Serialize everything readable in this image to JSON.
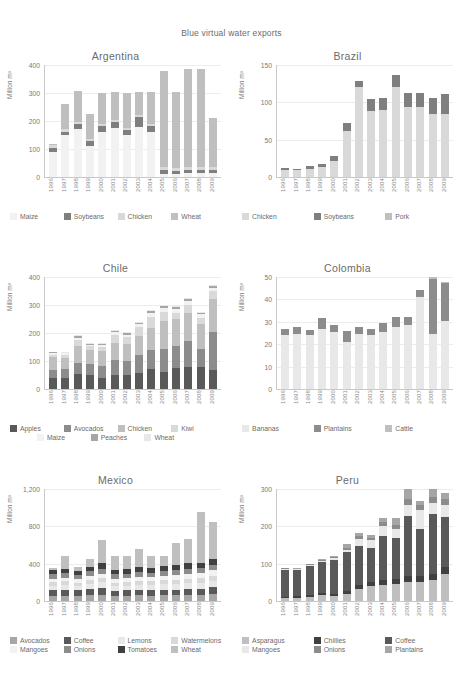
{
  "figure": {
    "title": "Blue virtual water exports",
    "ylabel": "Million m³"
  },
  "years": [
    "1996",
    "1997",
    "1998",
    "1999",
    "2000",
    "2001",
    "2002",
    "2003",
    "2004",
    "2005",
    "2006",
    "2007",
    "2008",
    "2009"
  ],
  "colors": {
    "c1": "#d9d9d9",
    "c2": "#7f7f7f",
    "c3": "#f2f2f2",
    "c4": "#bfbfbf",
    "c5": "#595959",
    "c6": "#a6a6a6",
    "c7": "#e8e8e8",
    "c8": "#8c8c8c"
  },
  "chart_data": [
    {
      "type": "bar",
      "title": "Argentina",
      "ylabel": "Million m³",
      "xlabel": "",
      "ylim": [
        0,
        400
      ],
      "yticks": [
        0,
        100,
        200,
        300,
        400
      ],
      "ytick_labels": [
        "0",
        "100",
        "200",
        "300",
        "400"
      ],
      "grid": true,
      "stacked": true,
      "legend_position": "bottom",
      "legend_columns": 4,
      "categories": [
        "1996",
        "1997",
        "1998",
        "1999",
        "2000",
        "2001",
        "2002",
        "2003",
        "2004",
        "2005",
        "2006",
        "2007",
        "2008",
        "2009"
      ],
      "series": [
        {
          "name": "Maize",
          "color": "#f2f2f2",
          "values": [
            88,
            150,
            170,
            110,
            160,
            175,
            150,
            180,
            160,
            10,
            10,
            14,
            14,
            14
          ]
        },
        {
          "name": "Soybeans",
          "color": "#7f7f7f",
          "values": [
            15,
            12,
            20,
            18,
            22,
            20,
            18,
            35,
            22,
            15,
            12,
            12,
            12,
            12
          ]
        },
        {
          "name": "Chicken",
          "color": "#d9d9d9",
          "values": [
            10,
            8,
            8,
            8,
            8,
            8,
            8,
            8,
            8,
            10,
            10,
            10,
            10,
            10
          ]
        },
        {
          "name": "Wheat",
          "color": "#bfbfbf",
          "values": [
            5,
            90,
            110,
            90,
            110,
            100,
            125,
            80,
            115,
            345,
            270,
            350,
            350,
            175
          ]
        }
      ]
    },
    {
      "type": "bar",
      "title": "Brazil",
      "ylabel": "Million m³",
      "xlabel": "",
      "ylim": [
        0,
        150
      ],
      "yticks": [
        0,
        50,
        100,
        150
      ],
      "ytick_labels": [
        "0",
        "50",
        "100",
        "150"
      ],
      "grid": true,
      "stacked": true,
      "legend_position": "bottom",
      "legend_columns": 3,
      "categories": [
        "1996",
        "1997",
        "1998",
        "1999",
        "2000",
        "2001",
        "2002",
        "2003",
        "2004",
        "2005",
        "2006",
        "2007",
        "2008",
        "2009"
      ],
      "series": [
        {
          "name": "Chicken",
          "color": "#d9d9d9",
          "values": [
            9,
            9,
            11,
            14,
            22,
            62,
            120,
            88,
            90,
            120,
            94,
            94,
            84,
            84
          ]
        },
        {
          "name": "Soybeans",
          "color": "#7f7f7f",
          "values": [
            3,
            2,
            4,
            4,
            6,
            10,
            9,
            16,
            16,
            17,
            18,
            18,
            22,
            27
          ]
        },
        {
          "name": "Pork",
          "color": "#bfbfbf",
          "values": [
            0,
            0,
            0,
            0,
            0,
            0,
            0,
            0,
            0,
            0,
            0,
            0,
            0,
            0
          ]
        }
      ]
    },
    {
      "type": "bar",
      "title": "Chile",
      "ylabel": "Million m³",
      "xlabel": "",
      "ylim": [
        0,
        400
      ],
      "yticks": [
        0,
        100,
        200,
        300,
        400
      ],
      "ytick_labels": [
        "0",
        "100",
        "200",
        "300",
        "400"
      ],
      "grid": true,
      "stacked": true,
      "legend_position": "bottom",
      "legend_columns": 4,
      "categories": [
        "1996",
        "1997",
        "1998",
        "1999",
        "2000",
        "2001",
        "2002",
        "2003",
        "2004",
        "2005",
        "2006",
        "2007",
        "2008",
        "2009"
      ],
      "series": [
        {
          "name": "Apples",
          "color": "#595959",
          "values": [
            40,
            40,
            52,
            50,
            40,
            50,
            50,
            58,
            72,
            62,
            75,
            78,
            78,
            68
          ]
        },
        {
          "name": "Avocados",
          "color": "#8c8c8c",
          "values": [
            28,
            30,
            42,
            40,
            44,
            52,
            50,
            62,
            68,
            82,
            78,
            92,
            65,
            135
          ]
        },
        {
          "name": "Chicken",
          "color": "#bfbfbf",
          "values": [
            45,
            42,
            60,
            50,
            52,
            62,
            62,
            68,
            78,
            100,
            98,
            100,
            88,
            118
          ]
        },
        {
          "name": "Kiwi",
          "color": "#d9d9d9",
          "values": [
            10,
            10,
            22,
            12,
            14,
            28,
            22,
            32,
            40,
            32,
            22,
            30,
            22,
            30
          ]
        },
        {
          "name": "Maize",
          "color": "#f2f2f2",
          "values": [
            5,
            5,
            8,
            6,
            8,
            10,
            10,
            12,
            14,
            14,
            14,
            14,
            14,
            10
          ]
        },
        {
          "name": "Peaches",
          "color": "#a6a6a6",
          "values": [
            3,
            3,
            5,
            4,
            4,
            5,
            5,
            5,
            6,
            6,
            6,
            6,
            6,
            6
          ]
        },
        {
          "name": "Wheat",
          "color": "#e8e8e8",
          "values": [
            2,
            2,
            3,
            3,
            3,
            3,
            3,
            3,
            4,
            4,
            4,
            4,
            4,
            4
          ]
        }
      ]
    },
    {
      "type": "bar",
      "title": "Colombia",
      "ylabel": "Million m³",
      "xlabel": "",
      "ylim": [
        0,
        50
      ],
      "yticks": [
        0,
        10,
        20,
        30,
        40,
        50
      ],
      "ytick_labels": [
        "0",
        "10",
        "20",
        "30",
        "40",
        "50"
      ],
      "grid": true,
      "stacked": true,
      "legend_position": "bottom",
      "legend_columns": 3,
      "categories": [
        "1996",
        "1997",
        "1998",
        "1999",
        "2000",
        "2001",
        "2002",
        "2003",
        "2004",
        "2005",
        "2006",
        "2007",
        "2008",
        "2009"
      ],
      "series": [
        {
          "name": "Bananas",
          "color": "#e8e8e8",
          "values": [
            24,
            24.5,
            24,
            27,
            25.5,
            21,
            24.5,
            24,
            25.5,
            27.5,
            28.5,
            41,
            26,
            30.5
          ]
        },
        {
          "name": "Plantains",
          "color": "#8c8c8c",
          "values": [
            3,
            3,
            2.5,
            4.5,
            3,
            5,
            3,
            3,
            4,
            4.5,
            3.5,
            3,
            26,
            17
          ]
        },
        {
          "name": "Cattle",
          "color": "#bfbfbf",
          "values": [
            0,
            0,
            0,
            0,
            0,
            0,
            0,
            0,
            0,
            0,
            0,
            0,
            1,
            0.5
          ]
        }
      ]
    },
    {
      "type": "bar",
      "title": "Mexico",
      "ylabel": "Million m³",
      "xlabel": "",
      "ylim": [
        0,
        1200
      ],
      "yticks": [
        0,
        400,
        800,
        1200
      ],
      "ytick_labels": [
        "0",
        "400",
        "800",
        "1,200"
      ],
      "grid": true,
      "stacked": true,
      "legend_position": "bottom",
      "legend_columns": 4,
      "categories": [
        "1996",
        "1997",
        "1998",
        "1999",
        "2000",
        "2001",
        "2002",
        "2003",
        "2004",
        "2005",
        "2006",
        "2007",
        "2008",
        "2009"
      ],
      "series": [
        {
          "name": "Avocados",
          "color": "#a6a6a6",
          "values": [
            55,
            58,
            55,
            60,
            62,
            55,
            55,
            60,
            58,
            60,
            62,
            65,
            68,
            75
          ]
        },
        {
          "name": "Coffee",
          "color": "#595959",
          "values": [
            60,
            62,
            58,
            70,
            80,
            55,
            58,
            60,
            58,
            62,
            60,
            62,
            62,
            75
          ]
        },
        {
          "name": "Lemons",
          "color": "#e8e8e8",
          "values": [
            50,
            52,
            48,
            55,
            58,
            50,
            52,
            55,
            55,
            58,
            60,
            62,
            65,
            68
          ]
        },
        {
          "name": "Watermelons",
          "color": "#d9d9d9",
          "values": [
            35,
            38,
            35,
            40,
            42,
            38,
            38,
            40,
            40,
            42,
            45,
            48,
            50,
            52
          ]
        },
        {
          "name": "Mangoes",
          "color": "#f2f2f2",
          "values": [
            40,
            42,
            38,
            45,
            48,
            42,
            42,
            45,
            45,
            48,
            50,
            52,
            55,
            58
          ]
        },
        {
          "name": "Onions",
          "color": "#8c8c8c",
          "values": [
            48,
            50,
            45,
            52,
            55,
            48,
            50,
            52,
            50,
            52,
            55,
            58,
            58,
            62
          ]
        },
        {
          "name": "Tomatoes",
          "color": "#404040",
          "values": [
            40,
            42,
            38,
            45,
            58,
            45,
            45,
            48,
            48,
            50,
            55,
            62,
            55,
            60
          ]
        },
        {
          "name": "Wheat",
          "color": "#bfbfbf",
          "values": [
            22,
            136,
            43,
            83,
            247,
            147,
            140,
            200,
            126,
            108,
            233,
            261,
            537,
            400
          ]
        }
      ]
    },
    {
      "type": "bar",
      "title": "Peru",
      "ylabel": "Million m³",
      "xlabel": "",
      "ylim": [
        0,
        300
      ],
      "yticks": [
        0,
        100,
        200,
        300
      ],
      "ytick_labels": [
        "0",
        "100",
        "200",
        "300"
      ],
      "grid": true,
      "stacked": true,
      "legend_position": "bottom",
      "legend_columns": 3,
      "categories": [
        "1996",
        "1997",
        "1998",
        "1999",
        "2000",
        "2001",
        "2002",
        "2003",
        "2004",
        "2005",
        "2006",
        "2007",
        "2008",
        "2009"
      ],
      "series": [
        {
          "name": "Asparagus",
          "color": "#bfbfbf",
          "values": [
            8,
            9,
            12,
            16,
            14,
            18,
            33,
            40,
            42,
            46,
            52,
            50,
            58,
            72
          ]
        },
        {
          "name": "Chillies",
          "color": "#404040",
          "values": [
            4,
            4,
            5,
            6,
            6,
            8,
            10,
            12,
            14,
            14,
            16,
            16,
            18,
            20
          ]
        },
        {
          "name": "Coffee",
          "color": "#595959",
          "values": [
            72,
            70,
            76,
            82,
            90,
            104,
            104,
            90,
            118,
            108,
            168,
            126,
            166,
            134
          ]
        },
        {
          "name": "Mangoes",
          "color": "#e8e8e8",
          "values": [
            2,
            2,
            3,
            4,
            5,
            8,
            20,
            22,
            28,
            26,
            30,
            52,
            32,
            32
          ]
        },
        {
          "name": "Onions",
          "color": "#8c8c8c",
          "values": [
            2,
            2,
            2,
            3,
            3,
            4,
            6,
            6,
            10,
            10,
            16,
            12,
            16,
            16
          ]
        },
        {
          "name": "Plantains",
          "color": "#a6a6a6",
          "values": [
            1,
            1,
            1,
            2,
            2,
            12,
            8,
            6,
            10,
            18,
            28,
            12,
            22,
            16
          ]
        }
      ]
    }
  ]
}
